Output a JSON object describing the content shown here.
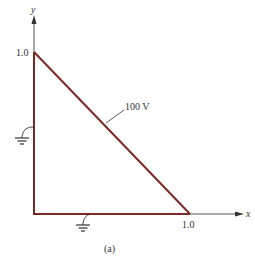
{
  "figure": {
    "caption": "(a)",
    "axes": {
      "x_label": "x",
      "y_label": "y",
      "x_tick": "1.0",
      "y_tick": "1.0"
    },
    "boundary_label": "100 V",
    "ground_symbols": [
      "left-edge-ground",
      "bottom-edge-ground"
    ],
    "colors": {
      "boundary": "#7a2a26",
      "axis": "#444444"
    }
  }
}
